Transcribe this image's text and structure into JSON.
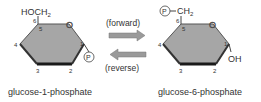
{
  "diagram": {
    "left": {
      "name": "glucose-1-phosphate",
      "substituent_top": "HOCH",
      "substituent_top_sub": "2",
      "ring_oxygen": "O",
      "carbon_labels": {
        "c1": "1",
        "c2": "2",
        "c3": "3",
        "c4": "4",
        "c5": "5",
        "c6": "6"
      },
      "phosphate": "P"
    },
    "right": {
      "name": "glucose-6-phosphate",
      "phosphate": "P",
      "substituent_top": "CH",
      "substituent_top_sub": "2",
      "ring_oxygen": "O",
      "carbon_labels": {
        "c1": "1",
        "c2": "2",
        "c3": "3",
        "c4": "4",
        "c5": "5",
        "c6": "6"
      },
      "hydroxyl": "OH"
    },
    "arrows": {
      "forward_label": "(forward)",
      "reverse_label": "(reverse)"
    },
    "colors": {
      "ring_fill": "#a6a6a6",
      "ring_edge": "#555555",
      "ring_bottom_edge": "#1a1a1a",
      "arrow_fill": "#9a9a9a",
      "text": "#333333"
    }
  }
}
